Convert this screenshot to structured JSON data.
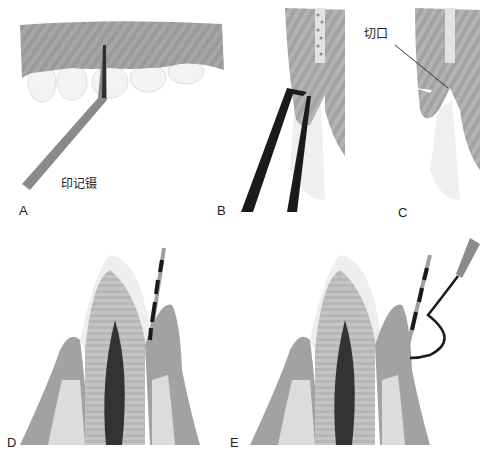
{
  "figure": {
    "panels": [
      {
        "letter": "A",
        "annotation": "印记镊",
        "description": "upper gingiva and teeth with pocket marking forceps inserted"
      },
      {
        "letter": "B",
        "annotation": "",
        "description": "cross-section with forceps beaks marking the pocket depth"
      },
      {
        "letter": "C",
        "annotation": "切口",
        "description": "cross-section showing incision line"
      },
      {
        "letter": "D",
        "annotation": "",
        "description": "tooth cross-section with periodontal probe in pocket"
      },
      {
        "letter": "E",
        "annotation": "",
        "description": "tooth cross-section with probe and curved explorer"
      }
    ]
  },
  "colors": {
    "background": "#ffffff",
    "gingiva": "#9a9a9a",
    "gingiva_light": "#b5b5b5",
    "enamel": "#ececec",
    "dentin": "#bdbdbd",
    "pulp": "#3a3a3a",
    "bone": "#dcdcdc",
    "bone_spots": "#8c8c8c",
    "instrument": "#1a1a1a",
    "instrument_handle": "#7a7a7a",
    "text": "#222222"
  }
}
